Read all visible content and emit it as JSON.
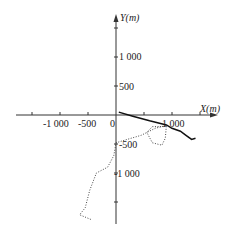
{
  "chart_data": {
    "type": "line",
    "title": "",
    "xlabel": "X(m)",
    "ylabel": "Y(m)",
    "origin_label": "0",
    "xlim": [
      -1450,
      1650
    ],
    "ylim": [
      -1900,
      1600
    ],
    "x_ticks": [
      -1500,
      -1000,
      -500,
      0,
      500,
      1000,
      1500
    ],
    "x_tick_labels": [
      "-1 000",
      "-500",
      "1 000"
    ],
    "y_ticks": [
      -1500,
      -1000,
      -500,
      0,
      500,
      1000,
      1500
    ],
    "y_tick_labels": [
      "1 000",
      "500",
      "-500",
      "-1 000"
    ],
    "grid": false,
    "legend": "none",
    "series": [
      {
        "name": "solid trajectory",
        "style": "solid",
        "color": "#111111",
        "points": [
          [
            50,
            50
          ],
          [
            300,
            -20
          ],
          [
            600,
            -100
          ],
          [
            900,
            -170
          ],
          [
            1000,
            -230
          ],
          [
            1150,
            -280
          ],
          [
            1250,
            -350
          ],
          [
            1350,
            -420
          ],
          [
            1420,
            -400
          ]
        ]
      },
      {
        "name": "dotted trajectory",
        "style": "dotted",
        "color": "#333333",
        "points": [
          [
            -450,
            -1800
          ],
          [
            -650,
            -1720
          ],
          [
            -550,
            -1600
          ],
          [
            -470,
            -1300
          ],
          [
            -350,
            -1000
          ],
          [
            -150,
            -900
          ],
          [
            -40,
            -700
          ],
          [
            0,
            -480
          ],
          [
            200,
            -420
          ],
          [
            450,
            -350
          ],
          [
            700,
            -230
          ],
          [
            900,
            -180
          ],
          [
            880,
            -400
          ],
          [
            820,
            -520
          ],
          [
            650,
            -480
          ],
          [
            550,
            -300
          ],
          [
            650,
            -200
          ],
          [
            850,
            -200
          ]
        ]
      }
    ]
  }
}
